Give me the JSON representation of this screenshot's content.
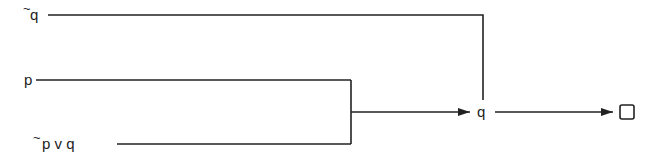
{
  "diagram": {
    "premises": [
      {
        "id": "premise-not-q",
        "negation": "~",
        "text": "q"
      },
      {
        "id": "premise-p",
        "negation": "",
        "text": "p"
      },
      {
        "id": "premise-not-p-or-q",
        "negation": "~",
        "text": "p v q"
      }
    ],
    "intermediate": {
      "id": "derived-q",
      "text": "q"
    },
    "conclusion": {
      "id": "contradiction",
      "symbol": "box",
      "meaning": "contradiction"
    },
    "edges": [
      {
        "from": [
          "premise-p",
          "premise-not-p-or-q"
        ],
        "to": "derived-q"
      },
      {
        "from": [
          "premise-not-q",
          "derived-q"
        ],
        "to": "contradiction"
      }
    ],
    "color": "#222222"
  }
}
